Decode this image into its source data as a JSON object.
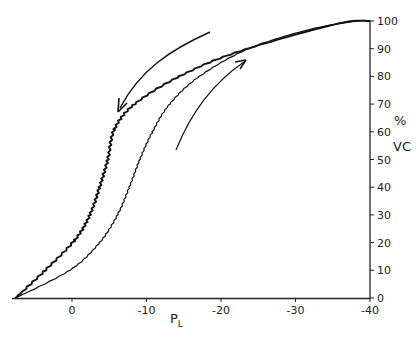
{
  "chart_data": {
    "type": "line",
    "title": "",
    "xlabel": "P",
    "xlabel_subscript": "L",
    "ylabel_line1": "%",
    "ylabel_line2": "VC",
    "xlim": [
      7,
      -40
    ],
    "ylim": [
      0,
      100
    ],
    "x_ticks": [
      0,
      -10,
      -20,
      -30,
      -40
    ],
    "x_tick_labels": [
      "0",
      "-10",
      "-20",
      "-30",
      "-40"
    ],
    "y_ticks": [
      0,
      10,
      20,
      30,
      40,
      50,
      60,
      70,
      80,
      90,
      100
    ],
    "y_tick_labels": [
      "0",
      "10",
      "20",
      "30",
      "40",
      "50",
      "60",
      "70",
      "80",
      "90",
      "100"
    ],
    "grid": false,
    "legend": "none",
    "annotations": [
      {
        "type": "arrow",
        "direction": "down-left",
        "meaning": "deflation"
      },
      {
        "type": "arrow",
        "direction": "up-right",
        "meaning": "inflation"
      }
    ],
    "series": [
      {
        "name": "deflation (upper-left limb)",
        "x": [
          7.6,
          3.6,
          -0.4,
          -2.4,
          -3.7,
          -4.8,
          -5.7,
          -8.4,
          -14.4,
          -22.4,
          -35.6,
          -40
        ],
        "y": [
          0,
          10,
          21,
          30,
          40,
          50,
          61,
          70,
          80,
          89,
          99,
          100
        ]
      },
      {
        "name": "inflation (lower-right limb)",
        "x": [
          7.6,
          0.3,
          -3.7,
          -6.1,
          -7.7,
          -9.1,
          -10.8,
          -13.1,
          -17.1,
          -23.7,
          -32,
          -38.4,
          -40
        ],
        "y": [
          0,
          10,
          20,
          30,
          40,
          50,
          60,
          70,
          80,
          90,
          97,
          100,
          100
        ]
      }
    ]
  }
}
